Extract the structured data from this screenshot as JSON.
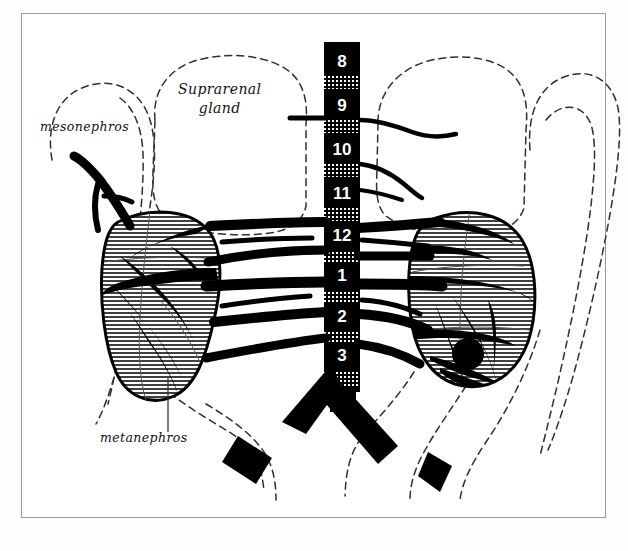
{
  "figure": {
    "title_labels": {
      "suprarenal_line1": "Suprarenal",
      "suprarenal_line2": "gland",
      "mesonephros": "mesonephros",
      "metanephros": "metanephros"
    },
    "colors": {
      "ink": "#000000",
      "paper": "#ffffff",
      "page": "#fdfdfc",
      "frame": "#9a9a9a",
      "hatch": "#000000",
      "dashed": "#3a3a3a"
    },
    "frame": {
      "x": 21,
      "y": 13,
      "width": 585,
      "height": 505
    }
  },
  "vertebral_column": {
    "name": "vertebral-column",
    "x": 324,
    "y": 42,
    "width": 36,
    "height": 350,
    "segments": [
      {
        "label": "8",
        "y": 44,
        "height": 34
      },
      {
        "label": "9",
        "y": 88,
        "height": 34
      },
      {
        "label": "10",
        "y": 132,
        "height": 34
      },
      {
        "label": "11",
        "y": 176,
        "height": 34
      },
      {
        "label": "12",
        "y": 220,
        "height": 34
      },
      {
        "label": "1",
        "y": 257,
        "height": 34
      },
      {
        "label": "2",
        "y": 301,
        "height": 34
      },
      {
        "label": "3",
        "y": 340,
        "height": 34
      }
    ],
    "disc_count": 8
  },
  "organs": {
    "left_kidney": {
      "name": "left-metanephros-kidney",
      "hatching": "horizontal-lines"
    },
    "right_kidney": {
      "name": "right-metanephros-kidney",
      "hatching": "horizontal-lines"
    },
    "left_suprarenal_outline": {
      "name": "left-suprarenal-gland-outline",
      "style": "dashed"
    },
    "right_suprarenal_outline": {
      "name": "right-suprarenal-gland-outline",
      "style": "dashed"
    },
    "left_mesonephros_outline": {
      "name": "left-mesonephros-outline",
      "style": "dashed"
    },
    "right_mesonephros_outline": {
      "name": "right-mesonephros-outline",
      "style": "dashed"
    }
  },
  "vessels": {
    "aorta": "abdominal-aorta",
    "bifurcation": "aortic-bifurcation",
    "iliac_left": "left-common-iliac-artery",
    "iliac_right": "right-common-iliac-artery",
    "renal_arteries_left_count": 5,
    "renal_arteries_right_count": 5,
    "suprarenal_arteries_count": 3
  }
}
